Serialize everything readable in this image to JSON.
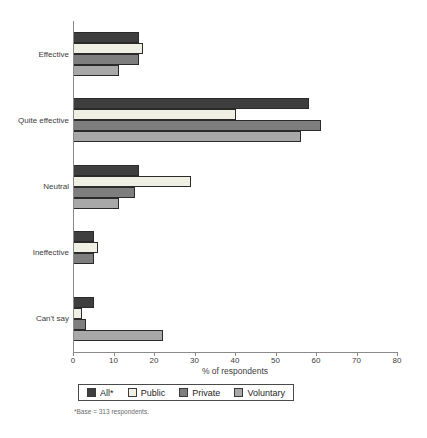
{
  "chart_data": {
    "type": "bar",
    "orientation": "horizontal",
    "title": "",
    "xlabel": "% of respondents",
    "xlim": [
      0,
      80
    ],
    "xticks": [
      0,
      10,
      20,
      30,
      40,
      50,
      60,
      70,
      80
    ],
    "grid": false,
    "legend_position": "bottom",
    "categories": [
      "Effective",
      "Quite effective",
      "Neutral",
      "Ineffective",
      "Can't say"
    ],
    "series": [
      {
        "name": "All*",
        "color": "#3e3e3e",
        "values": [
          16,
          58,
          16,
          5,
          5
        ]
      },
      {
        "name": "Public",
        "color": "#f0efe4",
        "values": [
          17,
          40,
          29,
          6,
          2
        ]
      },
      {
        "name": "Private",
        "color": "#7e7e7e",
        "values": [
          16,
          61,
          15,
          5,
          3
        ]
      },
      {
        "name": "Voluntary",
        "color": "#a8a8a8",
        "values": [
          11,
          56,
          11,
          0,
          22
        ]
      }
    ],
    "footnote": "*Base = 313 respondents."
  }
}
